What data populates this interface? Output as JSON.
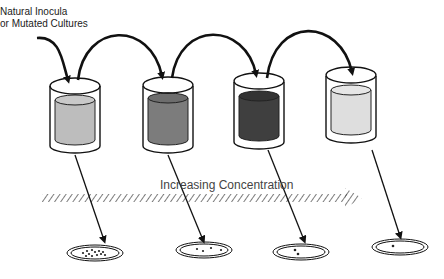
{
  "source_label": {
    "line1": "Natural Inocula",
    "line2": "or Mutated Cultures"
  },
  "gradient_label": "Increasing Concentration",
  "beakers": [
    {
      "name": "beaker-1",
      "liquid_color": "#bdbdbd"
    },
    {
      "name": "beaker-2",
      "liquid_color": "#7c7c7c"
    },
    {
      "name": "beaker-3",
      "liquid_color": "#3f3f3f"
    },
    {
      "name": "beaker-4",
      "liquid_color": "#dedede"
    }
  ],
  "plates": [
    {
      "name": "plate-1",
      "colonies": 12
    },
    {
      "name": "plate-2",
      "colonies": 4
    },
    {
      "name": "plate-3",
      "colonies": 2
    },
    {
      "name": "plate-4",
      "colonies": 1
    }
  ]
}
